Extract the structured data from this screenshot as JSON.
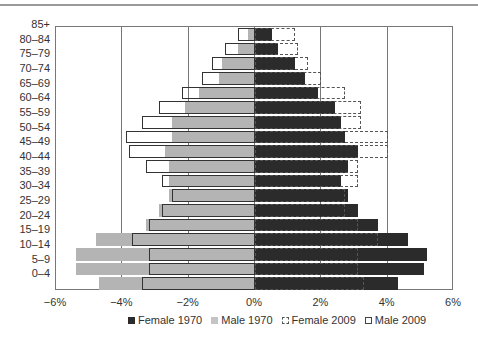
{
  "chart_data": {
    "type": "bar",
    "orientation": "horizontal",
    "subtype": "population-pyramid",
    "title": "",
    "xlabel": "",
    "ylabel": "",
    "xlim": [
      -6,
      6
    ],
    "x_ticks": [
      "-6%",
      "-4%",
      "-2%",
      "0%",
      "2%",
      "4%",
      "6%"
    ],
    "grid": "vertical",
    "legend_position": "bottom",
    "categories": [
      "85+",
      "80-84",
      "75-79",
      "70-74",
      "65-69",
      "60-64",
      "55-59",
      "50-54",
      "45-49",
      "40-44",
      "35-39",
      "30-34",
      "25-29",
      "20-24",
      "15-19",
      "10-14",
      "5-9",
      "0-4"
    ],
    "series": [
      {
        "name": "Female 1970",
        "style": "solid-dark",
        "values": [
          0.5,
          0.7,
          1.2,
          1.5,
          1.9,
          2.4,
          2.6,
          2.7,
          3.1,
          2.8,
          2.6,
          2.8,
          3.1,
          3.7,
          4.6,
          5.2,
          5.1,
          4.3
        ]
      },
      {
        "name": "Male 1970",
        "style": "solid-light",
        "values": [
          -0.2,
          -0.5,
          -1.0,
          -1.1,
          -1.7,
          -2.1,
          -2.5,
          -2.5,
          -2.7,
          -2.6,
          -2.6,
          -2.6,
          -2.9,
          -3.3,
          -4.8,
          -5.4,
          -5.4,
          -4.7
        ]
      },
      {
        "name": "Female 2009",
        "style": "dashed-outline",
        "values": [
          1.2,
          1.3,
          1.6,
          2.0,
          2.7,
          3.2,
          3.2,
          4.0,
          4.0,
          3.1,
          3.1,
          2.7,
          2.7,
          3.1,
          3.7,
          3.1,
          3.1,
          3.3
        ]
      },
      {
        "name": "Male 2009",
        "style": "solid-outline",
        "values": [
          -0.5,
          -0.9,
          -1.3,
          -1.6,
          -2.2,
          -2.9,
          -3.4,
          -3.9,
          -3.8,
          -3.3,
          -2.8,
          -2.5,
          -2.8,
          -3.2,
          -3.7,
          -3.2,
          -3.2,
          -3.4
        ]
      }
    ]
  },
  "legend": {
    "items": [
      {
        "label": "Female 1970",
        "swatch": "f1970"
      },
      {
        "label": "Male 1970",
        "swatch": "m1970"
      },
      {
        "label": "Female 2009",
        "swatch": "f2009"
      },
      {
        "label": "Male 2009",
        "swatch": "m2009"
      }
    ]
  },
  "colors": {
    "female_1970": "#2b2b2b",
    "male_1970": "#b4b4b4",
    "outline": "#333333"
  }
}
